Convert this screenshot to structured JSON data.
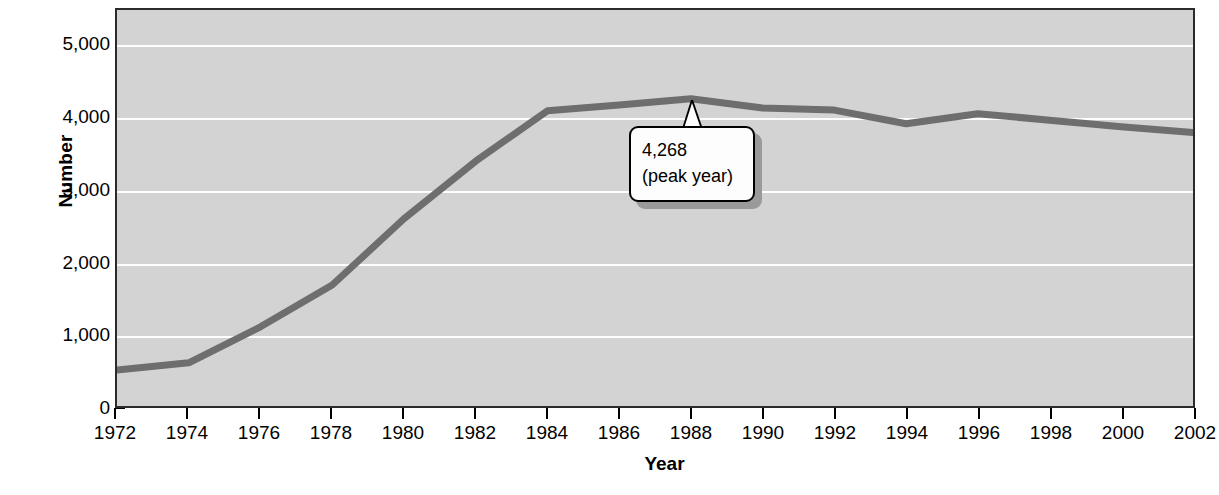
{
  "chart_data": {
    "type": "line",
    "title": "",
    "subtitle": "",
    "xlabel": "Year",
    "ylabel": "Number",
    "x": [
      1972,
      1974,
      1976,
      1978,
      1980,
      1982,
      1984,
      1986,
      1988,
      1990,
      1992,
      1994,
      1996,
      1998,
      2000,
      2002
    ],
    "series": [
      {
        "name": "Number",
        "values": [
          500,
          600,
          1100,
          1680,
          2600,
          3400,
          4100,
          4180,
          4268,
          4140,
          4110,
          3920,
          4060,
          3970,
          3880,
          3800
        ],
        "color": "#6e6e6e"
      }
    ],
    "xtick_labels": [
      "1972",
      "1974",
      "1976",
      "1978",
      "1980",
      "1982",
      "1984",
      "1986",
      "1988",
      "1990",
      "1992",
      "1994",
      "1996",
      "1998",
      "2000",
      "2002"
    ],
    "ytick_labels": [
      "0",
      "1,000",
      "2,000",
      "3,000",
      "4,000",
      "5,000"
    ],
    "ytick_values": [
      0,
      1000,
      2000,
      3000,
      4000,
      5000
    ],
    "xlim": [
      1972,
      2002
    ],
    "ylim": [
      0,
      5500
    ],
    "grid": true,
    "grid_axis": "y",
    "grid_color": "#fdfdfd",
    "plot_background": "#d3d3d3",
    "legend": false,
    "annotations": [
      {
        "name": "peak-callout",
        "value_label": "4,268",
        "note_label": "(peak year)",
        "points_to_x": 1988,
        "points_to_y": 4268
      }
    ]
  },
  "axes": {
    "y_title": "Number",
    "x_title": "Year"
  },
  "callout": {
    "value": "4,268",
    "note": "(peak year)"
  },
  "caption": {
    "text": ""
  }
}
